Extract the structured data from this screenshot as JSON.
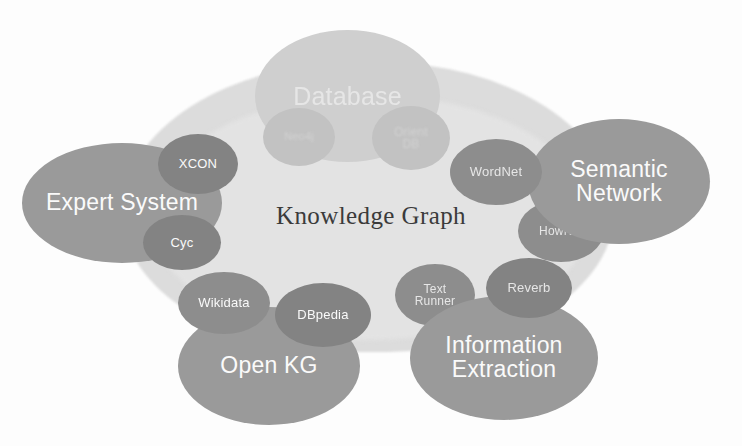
{
  "diagram": {
    "title": "Knowledge Graph",
    "background_color": "#fdfdfd",
    "center": {
      "label": "Knowledge Graph",
      "color": "#3b3b3b"
    },
    "groups": [
      {
        "id": "database",
        "label": "Database",
        "color": "#cfcfcf",
        "children": [
          {
            "id": "neo4j",
            "label": "Neo4j",
            "color": "#c2c2c2"
          },
          {
            "id": "orientdb",
            "label": "Orient\nDB",
            "color": "#c2c2c2"
          }
        ]
      },
      {
        "id": "expert-system",
        "label": "Expert System",
        "color": "#9a9a9a",
        "children": [
          {
            "id": "xcon",
            "label": "XCON",
            "color": "#838383"
          },
          {
            "id": "cyc",
            "label": "Cyc",
            "color": "#838383"
          }
        ]
      },
      {
        "id": "semantic-network",
        "label": "Semantic\nNetwork",
        "color": "#9a9a9a",
        "children": [
          {
            "id": "wordnet",
            "label": "WordNet",
            "color": "#8d8d8d"
          },
          {
            "id": "hownet",
            "label": "HowNet",
            "color": "#8d8d8d"
          }
        ]
      },
      {
        "id": "open-kg",
        "label": "Open KG",
        "color": "#9a9a9a",
        "children": [
          {
            "id": "wikidata",
            "label": "Wikidata",
            "color": "#8d8d8d"
          },
          {
            "id": "dbpedia",
            "label": "DBpedia",
            "color": "#838383"
          }
        ]
      },
      {
        "id": "information-extraction",
        "label": "Information\nExtraction",
        "color": "#9a9a9a",
        "children": [
          {
            "id": "textrunner",
            "label": "Text\nRunner",
            "color": "#8d8d8d"
          },
          {
            "id": "reverb",
            "label": "Reverb",
            "color": "#838383"
          }
        ]
      }
    ]
  }
}
